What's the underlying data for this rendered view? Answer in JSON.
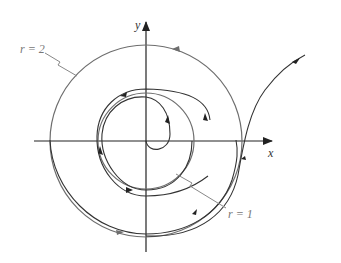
{
  "figure": {
    "type": "phase-portrait",
    "axes": {
      "x_label": "x",
      "y_label": "y"
    },
    "labels": {
      "outer_circle": "r = 2",
      "inner_circle": "r = 1"
    },
    "colors": {
      "axis": "#222222",
      "circle": "#6e6e6e",
      "trajectory": "#333333",
      "label": "#777777"
    }
  }
}
